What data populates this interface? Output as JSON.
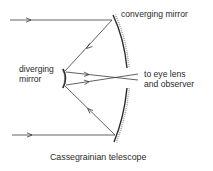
{
  "diagram": {
    "title": "Cassegrainian telescope",
    "labels": {
      "converging_mirror": "converging mirror",
      "diverging_mirror_line1": "diverging",
      "diverging_mirror_line2": "mirror",
      "output_line1": "to eye lens",
      "output_line2": "and observer"
    },
    "components": [
      {
        "name": "converging mirror",
        "type": "concave primary mirror (split, with central gap)"
      },
      {
        "name": "diverging mirror",
        "type": "convex secondary mirror"
      }
    ],
    "rays": [
      {
        "segment": "incoming top ray",
        "direction": "left-to-right",
        "arrow": true
      },
      {
        "segment": "incoming bottom ray",
        "direction": "left-to-right",
        "arrow": true
      },
      {
        "segment": "primary to secondary (top)",
        "direction": "toward diverging mirror",
        "arrow": true
      },
      {
        "segment": "primary to secondary (bottom)",
        "direction": "toward diverging mirror",
        "arrow": true
      },
      {
        "segment": "secondary to eyepiece (upper)",
        "direction": "left-to-right",
        "arrow": true
      },
      {
        "segment": "secondary to eyepiece (lower)",
        "direction": "left-to-right",
        "arrow": true
      }
    ],
    "colors": {
      "line": "#3a3a3a",
      "mirror": "#2a2a2a",
      "background": "#ffffff"
    }
  }
}
